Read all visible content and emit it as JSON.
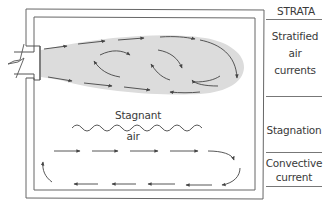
{
  "diagram": {
    "header": "STRATA",
    "strata": [
      {
        "name": "stratified",
        "label_lines": [
          "Stratified",
          "air",
          "currents"
        ]
      },
      {
        "name": "stagnation",
        "label_lines": [
          "Stagnation"
        ]
      },
      {
        "name": "convective",
        "label_lines": [
          "Convective",
          "current"
        ]
      }
    ],
    "annotations": {
      "stagnant_line1": "Stagnant",
      "stagnant_line2": "air"
    },
    "colors": {
      "line": "#555555",
      "plume_fill": "#dcdcdc",
      "text": "#3a3a3a"
    }
  }
}
